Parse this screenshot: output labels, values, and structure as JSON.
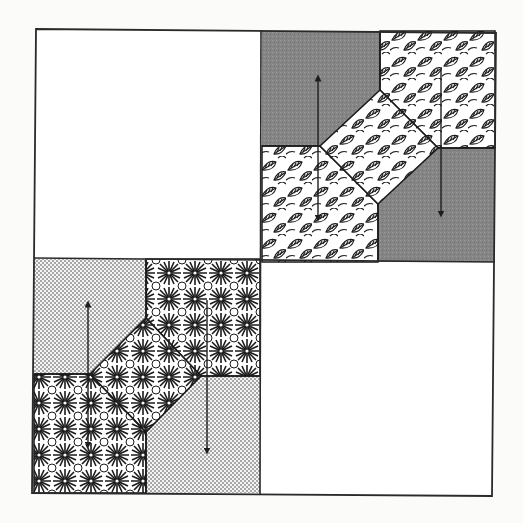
{
  "figure": {
    "title": "",
    "colors": {
      "background": "#fbfbfa",
      "outline": "#2a2a2a",
      "gray_fabric": "#858585",
      "plain_square": "#ffffff",
      "arrow": "#1e1e1e"
    }
  },
  "quadrants": [
    {
      "position": "top-left",
      "type": "plain",
      "fill": "white"
    },
    {
      "position": "top-right",
      "type": "pieced",
      "fabrics": [
        "gray",
        "leaf-print"
      ],
      "arrows": [
        {
          "x": "left",
          "direction": "up"
        },
        {
          "x": "right",
          "direction": "down"
        }
      ]
    },
    {
      "position": "bottom-left",
      "type": "pieced",
      "fabrics": [
        "stipple-dot",
        "geometric-floral"
      ],
      "arrows": [
        {
          "x": "left",
          "direction": "up"
        },
        {
          "x": "right",
          "direction": "down"
        }
      ]
    },
    {
      "position": "bottom-right",
      "type": "plain",
      "fill": "white"
    }
  ]
}
